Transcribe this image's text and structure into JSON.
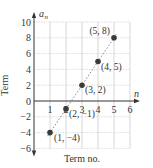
{
  "chart_data": {
    "type": "scatter",
    "title": "",
    "xlabel": "Term no.",
    "ylabel": "Term",
    "x_axis_var": "n",
    "y_axis_var": "a_n",
    "xlim": [
      0,
      6
    ],
    "ylim": [
      -6,
      10
    ],
    "x_ticks": [
      1,
      2,
      3,
      4,
      5,
      6
    ],
    "y_ticks": [
      -6,
      -4,
      -2,
      0,
      2,
      4,
      6,
      8,
      10
    ],
    "grid": true,
    "trend_line": "dashed",
    "points": [
      {
        "x": 1,
        "y": -4,
        "label": "(1, −4)"
      },
      {
        "x": 2,
        "y": -1,
        "label": "(2, −1)"
      },
      {
        "x": 3,
        "y": 2,
        "label": "(3, 2)"
      },
      {
        "x": 4,
        "y": 5,
        "label": "(4, 5)"
      },
      {
        "x": 5,
        "y": 8,
        "label": "(5, 8)"
      }
    ],
    "colors": {
      "point": "#3a3a3a",
      "grid": "#bdbdbd",
      "axis": "#333333",
      "trend": "#8a8a8a"
    }
  }
}
